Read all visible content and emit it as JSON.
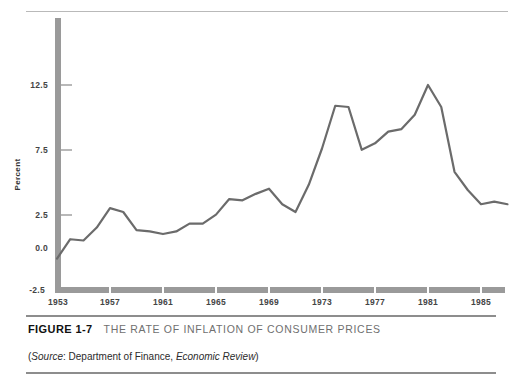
{
  "figure": {
    "number_label": "FIGURE 1-7",
    "title": "THE RATE OF INFLATION OF CONSUMER PRICES",
    "source_prefix": "(",
    "source_word": "Source",
    "source_mid": ": Department of Finance, ",
    "source_publication": "Economic Review",
    "source_suffix": ")"
  },
  "colors": {
    "line": "#6b6b6b",
    "axis": "#9a9a9a",
    "rule": "#8d8d8d",
    "tick_text": "#444444",
    "title_text": "#6f6f6f"
  },
  "chart_data": {
    "type": "line",
    "title": "THE RATE OF INFLATION OF CONSUMER PRICES",
    "xlabel": "",
    "ylabel": "Percent",
    "grid": false,
    "legend": "none",
    "xlim": [
      1953,
      1987
    ],
    "ylim": [
      -2.5,
      14.5
    ],
    "ytick_labels": [
      "12.5",
      "7.5",
      "2.5",
      "0.0",
      "-2.5"
    ],
    "ytick_values": [
      12.5,
      7.5,
      2.5,
      0.0,
      -2.5
    ],
    "xtick_labels": [
      "1953",
      "1957",
      "1961",
      "1965",
      "1969",
      "1973",
      "1977",
      "1981",
      "1985"
    ],
    "xtick_values": [
      1953,
      1957,
      1961,
      1965,
      1969,
      1973,
      1977,
      1981,
      1985
    ],
    "x": [
      1953,
      1954,
      1955,
      1956,
      1957,
      1958,
      1959,
      1960,
      1961,
      1962,
      1963,
      1964,
      1965,
      1966,
      1967,
      1968,
      1969,
      1970,
      1971,
      1972,
      1973,
      1974,
      1975,
      1976,
      1977,
      1978,
      1979,
      1980,
      1981,
      1982,
      1983,
      1984,
      1985,
      1986,
      1987
    ],
    "values": [
      -0.9,
      0.6,
      0.5,
      1.5,
      3.0,
      2.7,
      1.3,
      1.2,
      1.0,
      1.2,
      1.8,
      1.8,
      2.5,
      3.7,
      3.6,
      4.1,
      4.5,
      3.3,
      2.7,
      4.8,
      7.6,
      10.9,
      10.8,
      7.5,
      8.0,
      8.9,
      9.1,
      10.2,
      12.5,
      10.8,
      5.8,
      4.4,
      3.3,
      3.5,
      3.3
    ],
    "series": [
      {
        "name": "Rate of inflation of consumer prices",
        "values": [
          -0.9,
          0.6,
          0.5,
          1.5,
          3.0,
          2.7,
          1.3,
          1.2,
          1.0,
          1.2,
          1.8,
          1.8,
          2.5,
          3.7,
          3.6,
          4.1,
          4.5,
          3.3,
          2.7,
          4.8,
          7.6,
          10.9,
          10.8,
          7.5,
          8.0,
          8.9,
          9.1,
          10.2,
          12.5,
          10.8,
          5.8,
          4.4,
          3.3,
          3.5,
          3.3
        ]
      }
    ]
  }
}
